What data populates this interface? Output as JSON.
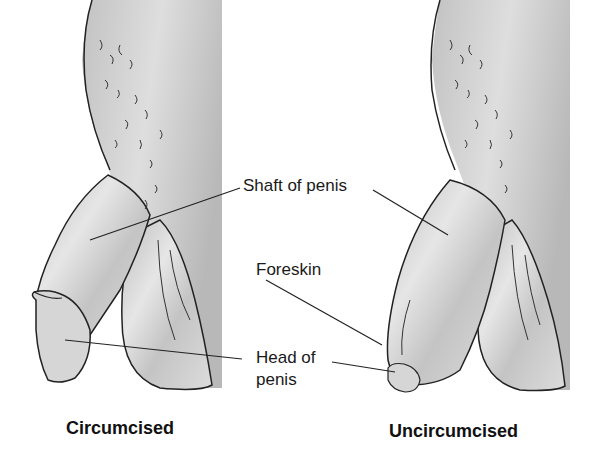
{
  "diagram": {
    "labels": {
      "shaft": "Shaft of penis",
      "foreskin": "Foreskin",
      "head_line1": "Head of",
      "head_line2": "penis"
    },
    "captions": {
      "left": "Circumcised",
      "right": "Uncircumcised"
    },
    "colors": {
      "background": "#ffffff",
      "skin_fill": "#d4d4d4",
      "body_fill": "#c8c8c8",
      "outline": "#222222"
    }
  }
}
